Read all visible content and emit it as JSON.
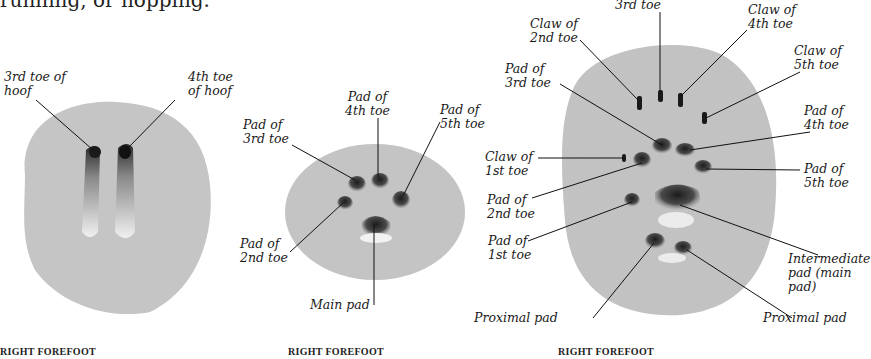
{
  "intro_text": "running, or hopping.",
  "colors": {
    "sand": "#c9c9c9",
    "sand_dark": "#a9a9a9",
    "imprint": "#2a2a2a",
    "leader_line": "#111111",
    "text": "#1a1a1a"
  },
  "panels": [
    {
      "id": "hoof",
      "caption": "RIGHT FOREFOOT",
      "labels": [
        {
          "key": "third_toe_hoof",
          "text": "3rd toe of\nhoof"
        },
        {
          "key": "fourth_toe_hoof",
          "text": "4th toe\nof hoof"
        }
      ]
    },
    {
      "id": "round-paw",
      "caption": "RIGHT FOREFOOT",
      "labels": [
        {
          "key": "pad_4th",
          "text": "Pad of\n4th toe"
        },
        {
          "key": "pad_3rd",
          "text": "Pad of\n3rd toe"
        },
        {
          "key": "pad_5th",
          "text": "Pad of\n5th toe"
        },
        {
          "key": "pad_2nd",
          "text": "Pad of\n2nd toe"
        },
        {
          "key": "main_pad",
          "text": "Main pad"
        }
      ]
    },
    {
      "id": "clawed-paw",
      "caption": "RIGHT FOREFOOT",
      "labels": [
        {
          "key": "claw_3rd",
          "text": "3rd toe"
        },
        {
          "key": "claw_2nd",
          "text": "Claw of\n2nd toe"
        },
        {
          "key": "claw_4th",
          "text": "Claw of\n4th toe"
        },
        {
          "key": "claw_5th",
          "text": "Claw of\n5th toe"
        },
        {
          "key": "pad_3rd",
          "text": "Pad of\n3rd toe"
        },
        {
          "key": "pad_4th",
          "text": "Pad of\n4th toe"
        },
        {
          "key": "claw_1st",
          "text": "Claw of\n1st toe"
        },
        {
          "key": "pad_5th",
          "text": "Pad of\n5th toe"
        },
        {
          "key": "pad_2nd",
          "text": "Pad of\n2nd toe"
        },
        {
          "key": "pad_1st",
          "text": "Pad of\n1st toe"
        },
        {
          "key": "intermediate_pad",
          "text": "Intermediate\npad (main\npad)"
        },
        {
          "key": "proximal_pad_left",
          "text": "Proximal pad"
        },
        {
          "key": "proximal_pad_right",
          "text": "Proximal pad"
        }
      ]
    }
  ]
}
